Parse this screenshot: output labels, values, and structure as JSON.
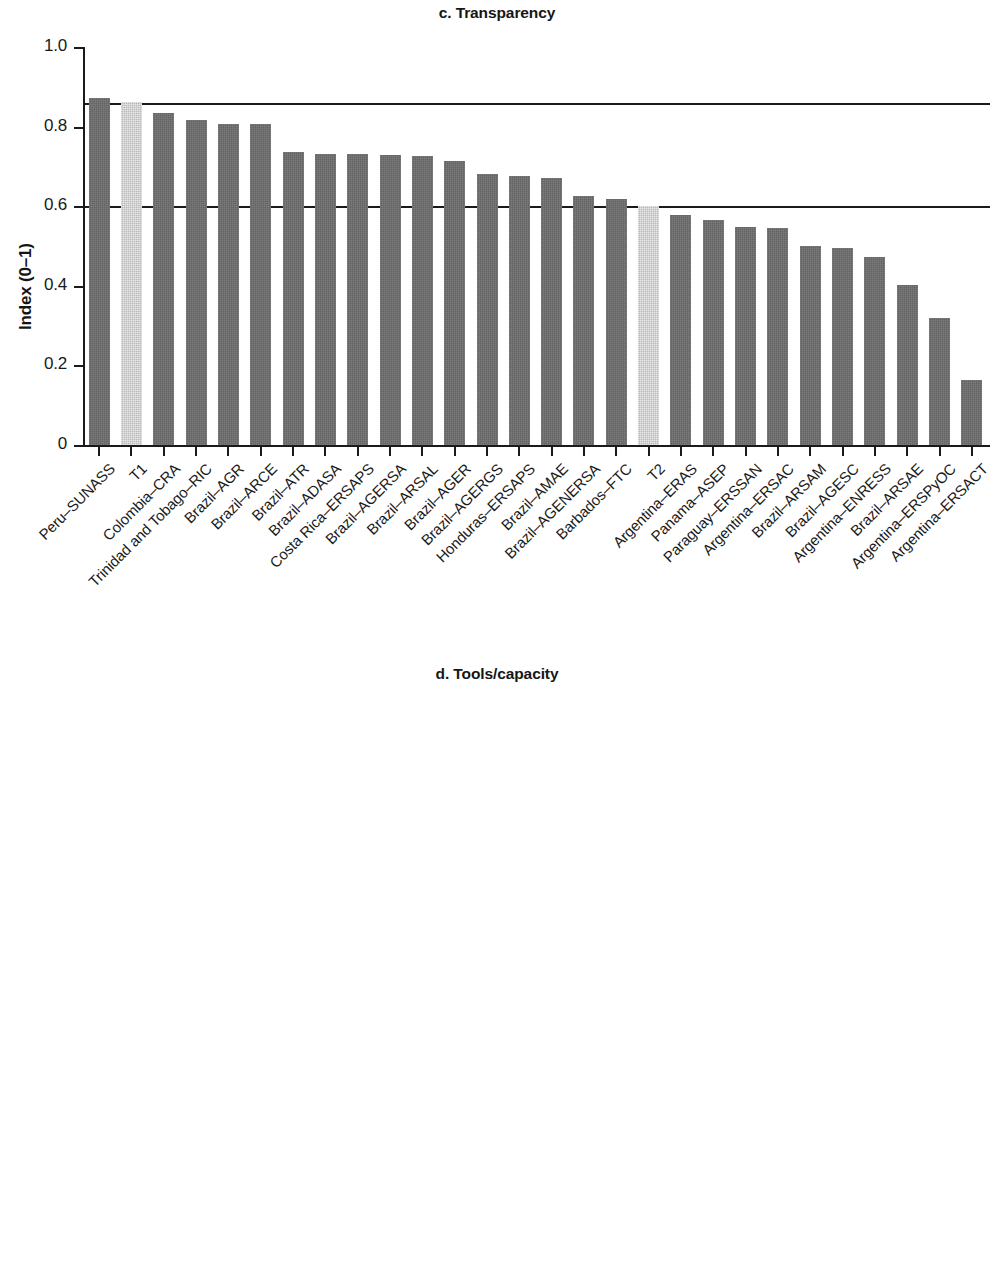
{
  "figure": {
    "panels": [
      {
        "id": "c",
        "title": "c. Transparency",
        "ylabel": "Index (0–1)"
      },
      {
        "id": "d",
        "title": "d. Tools/capacity",
        "ylabel": "Index (0–1)"
      }
    ]
  },
  "chart_data": [
    {
      "type": "bar",
      "title": "c. Transparency",
      "xlabel": "",
      "ylabel": "Index (0–1)",
      "ylim": [
        0,
        1.0
      ],
      "yticks": [
        0,
        0.2,
        0.4,
        0.6,
        0.8,
        1.0
      ],
      "ytick_labels": [
        "0",
        "0.2",
        "0.4",
        "0.6",
        "0.8",
        "1.0"
      ],
      "grid": false,
      "legend": "none",
      "reference_lines": [
        0.86,
        0.6
      ],
      "highlight_color": "#cfcfcf",
      "bar_color": "#6e6e6e",
      "categories": [
        "Peru–SUNASS",
        "T1",
        "Colombia–CRA",
        "Trinidad and Tobago–RIC",
        "Brazil–AGR",
        "Brazil–ARCE",
        "Brazil–ATR",
        "Brazil–ADASA",
        "Costa Rica–ERSAPS",
        "Brazil–AGERSA",
        "Brazil–ARSAL",
        "Brazil–AGER",
        "Brazil–AGERGS",
        "Honduras–ERSAPS",
        "Brazil–AMAE",
        "Brazil–AGENERSA",
        "Barbados–FTC",
        "T2",
        "Argentina–ERAS",
        "Panama–ASEP",
        "Paraguay–ERSSAN",
        "Argentina–ERSAC",
        "Brazil–ARSAM",
        "Brazil–AGESC",
        "Argentina–ENRESS",
        "Brazil–ARSAE",
        "Argentina–ERSPyOC",
        "Argentina–ERSACT"
      ],
      "values": [
        0.872,
        0.862,
        0.833,
        0.816,
        0.807,
        0.806,
        0.737,
        0.732,
        0.732,
        0.728,
        0.726,
        0.714,
        0.681,
        0.677,
        0.67,
        0.625,
        0.617,
        0.6,
        0.578,
        0.565,
        0.549,
        0.546,
        0.501,
        0.495,
        0.472,
        0.402,
        0.32,
        0.163
      ],
      "highlighted": [
        "T1",
        "T2"
      ]
    },
    {
      "type": "bar",
      "title": "d. Tools/capacity",
      "xlabel": "",
      "ylabel": "Index (0–1)",
      "ylim": [
        0,
        1.0
      ],
      "yticks": [
        0,
        0.2,
        0.4,
        0.6,
        0.8,
        1.0
      ],
      "ytick_labels": [
        "0",
        "0.2",
        "0.4",
        "0.6",
        "0.8",
        "1.0"
      ],
      "grid": false,
      "legend": "none",
      "reference_lines": [
        0.805,
        0.41
      ],
      "highlight_color": "#cfcfcf",
      "bar_color": "#6e6e6e",
      "categories": [
        "Brazil–AGERGS",
        "Colombia–CRA",
        "T1",
        "Honduras–ERSAPS",
        "Brazil–AGENERSA",
        "Brazil–ARCE",
        "Peru–SUNASS",
        "Brazil–AGERSA",
        "Trinidad and Tobago–RIC",
        "Argentina–ERAS",
        "Costa Rica–ERSAPS",
        "Brazil–AGR",
        "Brazil–AGER",
        "Brazil–AMAE",
        "Barbados–FTC",
        "Brazil–ATR",
        "Brazil–AGESC",
        "Brazil–ARSAM",
        "Brazil–ARSAL",
        "Panama–ASEP",
        "Argentina–ENRESS",
        "Brazil–ADASA",
        "T2",
        "Paraguay–ERSSAN",
        "Argentina–ERSAC",
        "Brazil–ARSAE",
        "Argentina–ERSPyOC",
        "Argentina–ERSACT"
      ],
      "values": [
        0.846,
        0.84,
        0.805,
        0.737,
        0.705,
        0.697,
        0.68,
        0.679,
        0.66,
        0.623,
        0.597,
        0.593,
        0.567,
        0.521,
        0.514,
        0.513,
        0.463,
        0.459,
        0.441,
        0.422,
        0.406,
        0.405,
        0.405,
        0.38,
        0.36,
        0.299,
        0.271,
        0.129
      ],
      "highlighted": [
        "T1",
        "T2"
      ]
    }
  ]
}
